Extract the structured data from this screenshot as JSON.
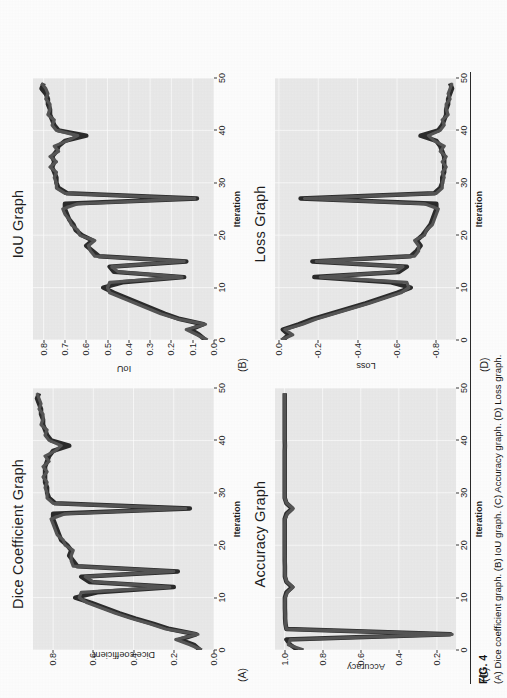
{
  "figure": {
    "number_label": "FIG. 4",
    "caption": "(A) Dice coefficient graph. (B) IoU graph. (C) Accuracy graph. (D) Loss graph.",
    "page_orientation": "figure rotated 90 degrees counter-clockwise on portrait page",
    "panel_background_color": "#e9e9e9",
    "gridline_color": "#ffffff",
    "series_colors": [
      "#2b2b2b",
      "#555555"
    ]
  },
  "panels": [
    {
      "tag": "(A)",
      "title": "Dice Coefficient Graph",
      "xlabel": "Iteration",
      "ylabel": "Dice coefficient",
      "xticks": [
        "0",
        "10",
        "20",
        "30",
        "40",
        "50"
      ],
      "yticks": [
        "0.0",
        "0.2",
        "0.4",
        "0.6",
        "0.8"
      ]
    },
    {
      "tag": "(B)",
      "title": "IoU Graph",
      "xlabel": "Iteration",
      "ylabel": "IoU",
      "xticks": [
        "0",
        "10",
        "20",
        "30",
        "40",
        "50"
      ],
      "yticks": [
        "0.0",
        "0.1",
        "0.2",
        "0.3",
        "0.4",
        "0.5",
        "0.6",
        "0.7",
        "0.8"
      ]
    },
    {
      "tag": "(C)",
      "title": "Accuracy Graph",
      "xlabel": "Iteration",
      "ylabel": "Accuracy",
      "xticks": [
        "0",
        "10",
        "20",
        "30",
        "40",
        "50"
      ],
      "yticks": [
        "0.2",
        "0.4",
        "0.6",
        "0.8",
        "1.0"
      ]
    },
    {
      "tag": "(D)",
      "title": "Loss Graph",
      "xlabel": "Iteration",
      "ylabel": "Loss",
      "xticks": [
        "0",
        "10",
        "20",
        "30",
        "40",
        "50"
      ],
      "yticks": [
        "-0.8",
        "-0.6",
        "-0.4",
        "-0.2",
        "0.0"
      ]
    }
  ],
  "chart_data": [
    {
      "type": "line",
      "title": "Dice Coefficient Graph",
      "xlabel": "Iteration",
      "ylabel": "Dice coefficient",
      "xlim": [
        0,
        50
      ],
      "ylim": [
        0.0,
        0.9
      ],
      "grid": true,
      "legend": "none",
      "x": [
        0,
        1,
        2,
        3,
        4,
        5,
        6,
        7,
        8,
        9,
        10,
        11,
        12,
        13,
        14,
        15,
        16,
        17,
        18,
        19,
        20,
        21,
        22,
        23,
        24,
        25,
        26,
        27,
        28,
        29,
        30,
        31,
        32,
        33,
        34,
        35,
        36,
        37,
        38,
        39,
        40,
        41,
        42,
        43,
        44,
        45,
        46,
        47,
        48,
        49
      ],
      "series": [
        {
          "name": "train",
          "values": [
            0.07,
            0.1,
            0.17,
            0.09,
            0.22,
            0.3,
            0.39,
            0.47,
            0.54,
            0.61,
            0.69,
            0.58,
            0.2,
            0.62,
            0.66,
            0.18,
            0.68,
            0.7,
            0.72,
            0.71,
            0.73,
            0.76,
            0.77,
            0.78,
            0.79,
            0.8,
            0.8,
            0.12,
            0.79,
            0.82,
            0.83,
            0.83,
            0.84,
            0.84,
            0.84,
            0.84,
            0.83,
            0.82,
            0.8,
            0.72,
            0.81,
            0.83,
            0.84,
            0.85,
            0.85,
            0.86,
            0.86,
            0.87,
            0.88,
            0.87
          ]
        },
        {
          "name": "validation",
          "values": [
            0.06,
            0.12,
            0.19,
            0.08,
            0.24,
            0.32,
            0.41,
            0.49,
            0.56,
            0.63,
            0.67,
            0.66,
            0.22,
            0.6,
            0.64,
            0.2,
            0.7,
            0.71,
            0.71,
            0.7,
            0.74,
            0.75,
            0.78,
            0.79,
            0.8,
            0.81,
            0.74,
            0.14,
            0.8,
            0.83,
            0.83,
            0.84,
            0.83,
            0.85,
            0.83,
            0.85,
            0.82,
            0.84,
            0.79,
            0.76,
            0.82,
            0.84,
            0.83,
            0.86,
            0.85,
            0.85,
            0.87,
            0.86,
            0.87,
            0.88
          ]
        }
      ]
    },
    {
      "type": "line",
      "title": "IoU Graph",
      "xlabel": "Iteration",
      "ylabel": "IoU",
      "xlim": [
        0,
        50
      ],
      "ylim": [
        0.0,
        0.85
      ],
      "grid": true,
      "legend": "none",
      "x": [
        0,
        1,
        2,
        3,
        4,
        5,
        6,
        7,
        8,
        9,
        10,
        11,
        12,
        13,
        14,
        15,
        16,
        17,
        18,
        19,
        20,
        21,
        22,
        23,
        24,
        25,
        26,
        27,
        28,
        29,
        30,
        31,
        32,
        33,
        34,
        35,
        36,
        37,
        38,
        39,
        40,
        41,
        42,
        43,
        44,
        45,
        46,
        47,
        48,
        49
      ],
      "series": [
        {
          "name": "train",
          "values": [
            0.04,
            0.07,
            0.11,
            0.05,
            0.16,
            0.23,
            0.29,
            0.35,
            0.41,
            0.47,
            0.52,
            0.43,
            0.14,
            0.47,
            0.49,
            0.13,
            0.54,
            0.57,
            0.6,
            0.57,
            0.62,
            0.65,
            0.66,
            0.68,
            0.69,
            0.7,
            0.7,
            0.08,
            0.69,
            0.73,
            0.74,
            0.74,
            0.75,
            0.76,
            0.75,
            0.76,
            0.74,
            0.73,
            0.7,
            0.6,
            0.73,
            0.75,
            0.76,
            0.77,
            0.77,
            0.78,
            0.78,
            0.79,
            0.81,
            0.8
          ]
        },
        {
          "name": "validation",
          "values": [
            0.03,
            0.08,
            0.13,
            0.04,
            0.17,
            0.25,
            0.31,
            0.37,
            0.43,
            0.49,
            0.5,
            0.49,
            0.15,
            0.45,
            0.48,
            0.14,
            0.56,
            0.58,
            0.59,
            0.56,
            0.63,
            0.64,
            0.67,
            0.68,
            0.7,
            0.71,
            0.64,
            0.09,
            0.7,
            0.74,
            0.74,
            0.75,
            0.74,
            0.77,
            0.74,
            0.77,
            0.73,
            0.75,
            0.69,
            0.64,
            0.74,
            0.76,
            0.75,
            0.78,
            0.77,
            0.77,
            0.79,
            0.78,
            0.79,
            0.81
          ]
        }
      ]
    },
    {
      "type": "line",
      "title": "Accuracy Graph",
      "xlabel": "Iteration",
      "ylabel": "Accuracy",
      "xlim": [
        0,
        50
      ],
      "ylim": [
        0.1,
        1.05
      ],
      "grid": true,
      "legend": "none",
      "x": [
        0,
        1,
        2,
        3,
        4,
        5,
        6,
        7,
        8,
        9,
        10,
        11,
        12,
        13,
        14,
        15,
        16,
        17,
        18,
        19,
        20,
        21,
        22,
        23,
        24,
        25,
        26,
        27,
        28,
        29,
        30,
        31,
        32,
        33,
        34,
        35,
        36,
        37,
        38,
        39,
        40,
        41,
        42,
        43,
        44,
        45,
        46,
        47,
        48,
        49
      ],
      "series": [
        {
          "name": "train",
          "values": [
            0.93,
            0.97,
            0.99,
            0.13,
            0.99,
            0.995,
            0.997,
            0.997,
            0.998,
            0.998,
            0.998,
            0.99,
            0.96,
            0.99,
            0.998,
            0.998,
            0.998,
            0.999,
            0.999,
            0.999,
            0.999,
            0.999,
            0.999,
            0.999,
            0.999,
            0.999,
            0.99,
            0.96,
            0.99,
            0.999,
            0.999,
            0.999,
            0.999,
            0.999,
            0.999,
            0.999,
            0.999,
            0.999,
            0.999,
            0.998,
            0.999,
            0.999,
            0.999,
            0.999,
            0.999,
            0.999,
            0.999,
            0.999,
            0.999,
            0.999
          ]
        },
        {
          "name": "validation",
          "values": [
            0.9,
            0.98,
            0.97,
            0.12,
            0.99,
            0.995,
            0.996,
            0.997,
            0.998,
            0.998,
            0.997,
            0.985,
            0.955,
            0.988,
            0.997,
            0.998,
            0.998,
            0.998,
            0.999,
            0.999,
            0.999,
            0.999,
            0.999,
            0.999,
            0.999,
            0.998,
            0.985,
            0.955,
            0.988,
            0.999,
            0.999,
            0.999,
            0.999,
            0.999,
            0.999,
            0.999,
            0.999,
            0.999,
            0.999,
            0.997,
            0.999,
            0.999,
            0.999,
            0.999,
            0.999,
            0.999,
            0.999,
            0.999,
            0.999,
            0.999
          ]
        }
      ]
    },
    {
      "type": "line",
      "title": "Loss Graph",
      "xlabel": "Iteration",
      "ylabel": "Loss",
      "xlim": [
        0,
        50
      ],
      "ylim": [
        -0.9,
        0.02
      ],
      "grid": true,
      "legend": "none",
      "x": [
        0,
        1,
        2,
        3,
        4,
        5,
        6,
        7,
        8,
        9,
        10,
        11,
        12,
        13,
        14,
        15,
        16,
        17,
        18,
        19,
        20,
        21,
        22,
        23,
        24,
        25,
        26,
        27,
        28,
        29,
        30,
        31,
        32,
        33,
        34,
        35,
        36,
        37,
        38,
        39,
        40,
        41,
        42,
        43,
        44,
        45,
        46,
        47,
        48,
        49
      ],
      "series": [
        {
          "name": "train",
          "values": [
            -0.02,
            -0.05,
            -0.02,
            -0.1,
            -0.17,
            -0.26,
            -0.35,
            -0.44,
            -0.52,
            -0.6,
            -0.67,
            -0.57,
            -0.18,
            -0.61,
            -0.65,
            -0.17,
            -0.67,
            -0.7,
            -0.72,
            -0.7,
            -0.73,
            -0.75,
            -0.77,
            -0.78,
            -0.79,
            -0.8,
            -0.8,
            -0.11,
            -0.79,
            -0.82,
            -0.83,
            -0.83,
            -0.84,
            -0.84,
            -0.84,
            -0.84,
            -0.83,
            -0.82,
            -0.8,
            -0.72,
            -0.81,
            -0.83,
            -0.84,
            -0.85,
            -0.85,
            -0.86,
            -0.86,
            -0.87,
            -0.88,
            -0.87
          ]
        },
        {
          "name": "validation",
          "values": [
            -0.01,
            -0.07,
            -0.03,
            -0.12,
            -0.19,
            -0.28,
            -0.37,
            -0.46,
            -0.54,
            -0.62,
            -0.66,
            -0.65,
            -0.21,
            -0.59,
            -0.63,
            -0.19,
            -0.69,
            -0.71,
            -0.71,
            -0.69,
            -0.74,
            -0.75,
            -0.78,
            -0.79,
            -0.8,
            -0.81,
            -0.74,
            -0.13,
            -0.8,
            -0.83,
            -0.83,
            -0.84,
            -0.83,
            -0.85,
            -0.83,
            -0.85,
            -0.82,
            -0.84,
            -0.79,
            -0.76,
            -0.82,
            -0.84,
            -0.83,
            -0.86,
            -0.85,
            -0.85,
            -0.87,
            -0.86,
            -0.87,
            -0.88
          ]
        }
      ]
    }
  ]
}
